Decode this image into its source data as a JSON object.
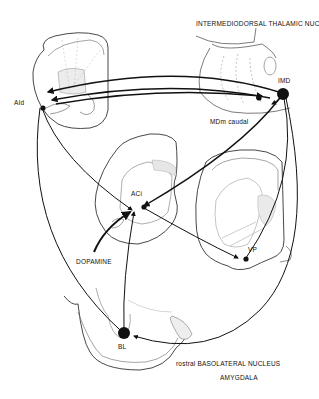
{
  "labels": {
    "thalamic_title": "INTERMEDIODORSAL THALAMIC NUCLEUS",
    "imd": "IMD",
    "mdm_caudal": "MDm caudal",
    "aid": "AId",
    "aci": "ACi",
    "dopamine": "DOPAMINE",
    "vp": "VP",
    "bl": "BL",
    "amygdala_title_line1": "rostral BASOLATERAL NUCLEUS",
    "amygdala_title_line2": "AMYGDALA"
  },
  "colors": {
    "ink": "#111111",
    "outline": "#333333",
    "faint": "#999999",
    "shade": "#e6e6e6",
    "background": "#ffffff"
  },
  "nodes": [
    {
      "id": "IMD",
      "role": "source nucleus (large dot)"
    },
    {
      "id": "MDm caudal",
      "role": "target"
    },
    {
      "id": "AId",
      "role": "agranular insular cortex, dorsal"
    },
    {
      "id": "ACi",
      "role": "nucleus accumbens region"
    },
    {
      "id": "VP",
      "role": "ventral pallidum"
    },
    {
      "id": "BL",
      "role": "basolateral amygdala (large dot)"
    }
  ]
}
